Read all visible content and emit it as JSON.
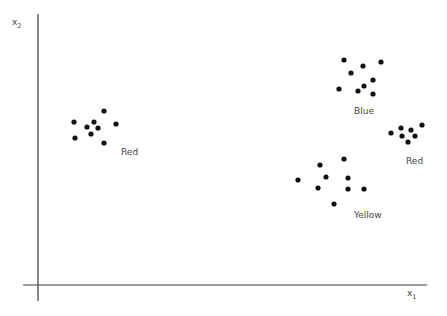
{
  "chart_data": {
    "type": "scatter",
    "title": "",
    "xlabel": "x1",
    "ylabel": "x2",
    "grid": false,
    "legend": "none",
    "ticks": "none",
    "series": [
      {
        "name": "Red",
        "label_pos": [
          121,
          155
        ],
        "points": [
          [
            74,
            122
          ],
          [
            104,
            111
          ],
          [
            87,
            127
          ],
          [
            94,
            122
          ],
          [
            98,
            128
          ],
          [
            91,
            134
          ],
          [
            116,
            124
          ],
          [
            75,
            138
          ],
          [
            104,
            143
          ]
        ]
      },
      {
        "name": "Blue",
        "label_pos": [
          354,
          114
        ],
        "points": [
          [
            344,
            60
          ],
          [
            363,
            66
          ],
          [
            381,
            62
          ],
          [
            351,
            73
          ],
          [
            373,
            80
          ],
          [
            364,
            86
          ],
          [
            339,
            89
          ],
          [
            358,
            91
          ],
          [
            373,
            94
          ]
        ]
      },
      {
        "name": "Red",
        "label_pos": [
          406,
          164
        ],
        "points": [
          [
            391,
            133
          ],
          [
            401,
            128
          ],
          [
            411,
            130
          ],
          [
            422,
            125
          ],
          [
            402,
            136
          ],
          [
            415,
            136
          ],
          [
            408,
            142
          ]
        ]
      },
      {
        "name": "Yellow",
        "label_pos": [
          354,
          218
        ],
        "points": [
          [
            298,
            180
          ],
          [
            320,
            165
          ],
          [
            344,
            159
          ],
          [
            326,
            177
          ],
          [
            348,
            178
          ],
          [
            318,
            188
          ],
          [
            348,
            189
          ],
          [
            364,
            189
          ],
          [
            334,
            204
          ]
        ]
      }
    ]
  },
  "axes": {
    "x_label": "x",
    "x_sub": "1",
    "y_label": "x",
    "y_sub": "2"
  }
}
